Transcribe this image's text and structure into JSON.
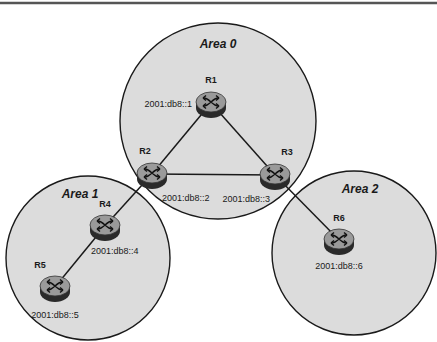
{
  "diagram": {
    "type": "network-topology",
    "protocol_context": "OSPFv3 areas",
    "colors": {
      "area_fill": "#dcdcdc",
      "area_stroke": "#1a1a1a",
      "router_top": "#9a9a9a",
      "router_side": "#2a2a2a",
      "link": "#1a1a1a",
      "top_rule": "#555555"
    },
    "areas": [
      {
        "id": "area0",
        "label": "Area 0",
        "cx": 218,
        "cy": 121,
        "r": 98
      },
      {
        "id": "area1",
        "label": "Area 1",
        "cx": 88,
        "cy": 258,
        "r": 82
      },
      {
        "id": "area2",
        "label": "Area 2",
        "cx": 354,
        "cy": 253,
        "r": 82
      }
    ],
    "routers": [
      {
        "id": "R1",
        "label": "R1",
        "address": "2001:db8::1",
        "x": 211,
        "y": 103
      },
      {
        "id": "R2",
        "label": "R2",
        "address": "2001:db8::2",
        "x": 152,
        "y": 174
      },
      {
        "id": "R3",
        "label": "R3",
        "address": "2001:db8::3",
        "x": 275,
        "y": 175
      },
      {
        "id": "R4",
        "label": "R4",
        "address": "2001:db8::4",
        "x": 105,
        "y": 226
      },
      {
        "id": "R5",
        "label": "R5",
        "address": "2001:db8::5",
        "x": 55,
        "y": 287
      },
      {
        "id": "R6",
        "label": "R6",
        "address": "2001:db8::6",
        "x": 339,
        "y": 240
      }
    ],
    "links": [
      {
        "from": "R1",
        "to": "R2"
      },
      {
        "from": "R1",
        "to": "R3"
      },
      {
        "from": "R2",
        "to": "R3"
      },
      {
        "from": "R2",
        "to": "R4"
      },
      {
        "from": "R4",
        "to": "R5"
      },
      {
        "from": "R3",
        "to": "R6"
      }
    ]
  }
}
